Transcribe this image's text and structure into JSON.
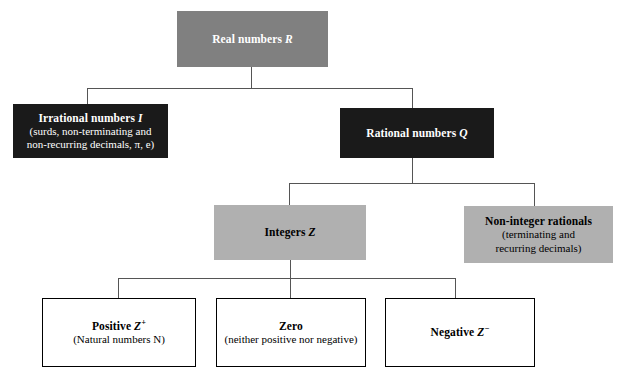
{
  "diagram": {
    "colors": {
      "gray_fill": "#808080",
      "light_gray_fill": "#b0b0b0",
      "black_fill": "#1a1a1a",
      "white_fill": "#ffffff",
      "connector": "#555555",
      "white_text": "#ffffff",
      "black_text": "#000000"
    },
    "nodes": {
      "real": {
        "title": "Real numbers",
        "symbol": "R",
        "sub_lines": [],
        "style": "gray-white-text"
      },
      "irrational": {
        "title": "Irrational numbers",
        "symbol": "I",
        "sub_lines": [
          "(surds, non-terminating and",
          "non-recurring decimals, π, e)"
        ],
        "style": "black-white-text"
      },
      "rational": {
        "title": "Rational numbers",
        "symbol": "Q",
        "sub_lines": [],
        "style": "black-white-text"
      },
      "integers": {
        "title": "Integers",
        "symbol": "Z",
        "sub_lines": [],
        "style": "gray-black-text"
      },
      "non_integer_rationals": {
        "title": "Non-integer rationals",
        "symbol": "",
        "sub_lines": [
          "(terminating and",
          "recurring decimals)"
        ],
        "style": "gray-black-text"
      },
      "positive": {
        "title": "Positive",
        "symbol": "Z",
        "sign": "+",
        "sub_lines": [
          "(Natural numbers N)"
        ],
        "style": "white-black-text"
      },
      "zero": {
        "title": "Zero",
        "symbol": "",
        "sub_lines": [
          "(neither positive nor negative)"
        ],
        "style": "white-black-text"
      },
      "negative": {
        "title": "Negative",
        "symbol": "Z",
        "sign": "−",
        "sub_lines": [],
        "style": "white-black-text"
      }
    }
  }
}
